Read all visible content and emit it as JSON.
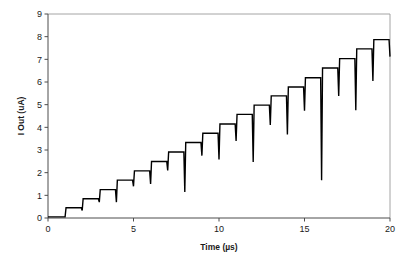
{
  "chart_data": {
    "type": "line",
    "title": "",
    "xlabel": "Time (µs)",
    "ylabel": "I Out (uA)",
    "xlim": [
      0,
      20
    ],
    "ylim": [
      0,
      9
    ],
    "xticks": [
      0,
      5,
      10,
      15,
      20
    ],
    "xticklabels": [
      "0",
      "5",
      "10",
      "15",
      "20"
    ],
    "yticks": [
      0,
      1,
      2,
      3,
      4,
      5,
      6,
      7,
      8,
      9
    ],
    "yticklabels": [
      "0",
      "1",
      "2",
      "3",
      "4",
      "5",
      "6",
      "7",
      "8",
      "9"
    ],
    "grid": false,
    "legend": null,
    "legend_position": "none",
    "line_color": "#000000",
    "line_width": 1.4,
    "series": [
      {
        "name": "I Out",
        "step_times": [
          0,
          1,
          2,
          3,
          4,
          5,
          6,
          7,
          8,
          9,
          10,
          11,
          12,
          13,
          14,
          15,
          16,
          17,
          18,
          19,
          20
        ],
        "step_levels": [
          0.05,
          0.45,
          0.85,
          1.25,
          1.67,
          2.08,
          2.49,
          2.91,
          3.33,
          3.74,
          4.15,
          4.57,
          4.98,
          5.39,
          5.78,
          6.19,
          6.62,
          7.03,
          7.46,
          7.87
        ],
        "glitches": [
          {
            "time": 1,
            "depth_to": 0.05
          },
          {
            "time": 2,
            "depth_to": 0.33
          },
          {
            "time": 3,
            "depth_to": 0.7
          },
          {
            "time": 4,
            "depth_to": 0.7
          },
          {
            "time": 5,
            "depth_to": 1.4
          },
          {
            "time": 6,
            "depth_to": 1.5
          },
          {
            "time": 7,
            "depth_to": 2.1
          },
          {
            "time": 8,
            "depth_to": 1.15
          },
          {
            "time": 9,
            "depth_to": 2.75
          },
          {
            "time": 10,
            "depth_to": 2.58
          },
          {
            "time": 11,
            "depth_to": 3.4
          },
          {
            "time": 12,
            "depth_to": 2.47
          },
          {
            "time": 13,
            "depth_to": 4.1
          },
          {
            "time": 14,
            "depth_to": 3.68
          },
          {
            "time": 15,
            "depth_to": 4.73
          },
          {
            "time": 16,
            "depth_to": 1.67
          },
          {
            "time": 17,
            "depth_to": 5.38
          },
          {
            "time": 18,
            "depth_to": 4.75
          },
          {
            "time": 19,
            "depth_to": 6.05
          },
          {
            "time": 20,
            "depth_to": 7.12
          }
        ]
      }
    ]
  }
}
